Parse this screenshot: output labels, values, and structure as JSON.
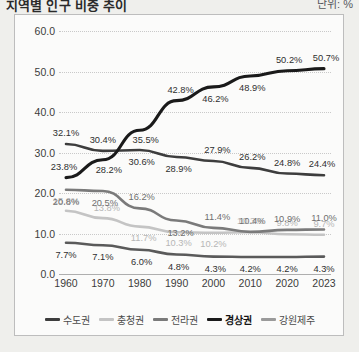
{
  "header": {
    "title": "지역별 인구 비중 추이",
    "title_right": "단위: %"
  },
  "chart_data": {
    "type": "line",
    "title": "지역별 인구 비중 추이",
    "xlabel": "",
    "ylabel": "",
    "ylim": [
      0,
      60
    ],
    "ytick_step": 10,
    "grid": true,
    "legend_position": "bottom",
    "categories": [
      "1960",
      "1970",
      "1980",
      "1990",
      "2000",
      "2010",
      "2020",
      "2023"
    ],
    "yticks": [
      "0.0",
      "10.0",
      "20.0",
      "30.0",
      "40.0",
      "50.0",
      "60.0"
    ],
    "series": [
      {
        "name": "수도권",
        "color": "#3d3d3d",
        "width": 2.6,
        "values": [
          32.1,
          30.4,
          30.6,
          28.9,
          27.9,
          26.2,
          24.8,
          24.4
        ],
        "labels": [
          "32.1%",
          "30.4%",
          "30.6%",
          "28.9%",
          "27.9%",
          "26.2%",
          "24.8%",
          "24.4%"
        ]
      },
      {
        "name": "충청권",
        "color": "#c4c4c4",
        "width": 2.6,
        "values": [
          15.6,
          13.8,
          11.7,
          10.3,
          10.2,
          10.3,
          9.8,
          9.7
        ],
        "labels": [
          "15.6%",
          "13.8%",
          "11.7%",
          "10.3%",
          "10.2%",
          "10.3%",
          "9.8%",
          "9.7%"
        ]
      },
      {
        "name": "전라권",
        "color": "#7a7a7a",
        "width": 2.6,
        "values": [
          20.8,
          20.5,
          16.2,
          13.2,
          11.4,
          10.4,
          10.9,
          11.0
        ],
        "labels": [
          "20.8%",
          "20.5%",
          "16.2%",
          "13.2%",
          "11.4%",
          "10.4%",
          "10.9%",
          "11.0%"
        ]
      },
      {
        "name": "경상권",
        "color": "#1a1a1a",
        "width": 3.1,
        "values": [
          23.8,
          28.2,
          35.5,
          42.8,
          46.2,
          48.9,
          50.2,
          50.7
        ],
        "labels": [
          "23.8%",
          "28.2%",
          "35.5%",
          "42.8%",
          "46.2%",
          "48.9%",
          "50.2%",
          "50.7%"
        ]
      },
      {
        "name": "강원제주",
        "color": "#5a5a5a",
        "width": 2.6,
        "values": [
          7.7,
          7.1,
          6.0,
          4.8,
          4.3,
          4.2,
          4.2,
          4.3
        ],
        "labels": [
          "7.7%",
          "7.1%",
          "6.0%",
          "4.8%",
          "4.3%",
          "4.2%",
          "4.2%",
          "4.3%"
        ]
      }
    ],
    "label_offsets": [
      {
        "series": "수도권",
        "dx": [
          0,
          0,
          2,
          2,
          4,
          2,
          0,
          -2
        ],
        "dy": [
          -11,
          -11,
          12,
          12,
          -11,
          -11,
          -11,
          -11
        ]
      },
      {
        "series": "충청권",
        "dx": [
          0,
          4,
          4,
          2,
          0,
          0,
          0,
          0
        ],
        "dy": [
          -10,
          -10,
          11,
          11,
          11,
          -11,
          -11,
          -11
        ]
      },
      {
        "series": "전라권",
        "dx": [
          0,
          2,
          2,
          4,
          4,
          2,
          0,
          0
        ],
        "dy": [
          12,
          12,
          -11,
          12,
          -11,
          -11,
          -11,
          -11
        ]
      },
      {
        "series": "경상권",
        "dx": [
          -2,
          6,
          6,
          4,
          2,
          2,
          2,
          2
        ],
        "dy": [
          -11,
          10,
          10,
          -11,
          12,
          12,
          -11,
          -11
        ]
      },
      {
        "series": "강원제주",
        "dx": [
          0,
          0,
          2,
          2,
          2,
          0,
          0,
          0
        ],
        "dy": [
          12,
          12,
          12,
          12,
          12,
          12,
          12,
          12
        ]
      }
    ]
  },
  "legend": {
    "items": [
      {
        "label": "수도권",
        "color": "#3d3d3d",
        "bold": false
      },
      {
        "label": "충청권",
        "color": "#c4c4c4",
        "bold": false
      },
      {
        "label": "전라권",
        "color": "#7a7a7a",
        "bold": false
      },
      {
        "label": "경상권",
        "color": "#1a1a1a",
        "bold": true
      },
      {
        "label": "강원제주",
        "color": "#9a9a9a",
        "bold": false
      }
    ]
  }
}
